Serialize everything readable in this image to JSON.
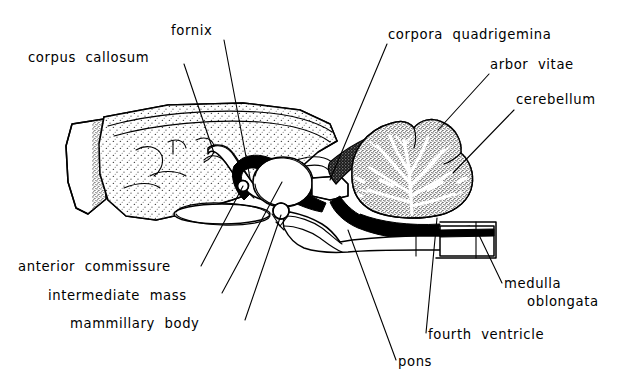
{
  "figure": {
    "background_color": "#ffffff",
    "ink_color": "#000000",
    "stipple_color": "#6b6b6b"
  },
  "labels": [
    {
      "id": "fornix",
      "text": "fornix",
      "x": 171,
      "y": 35,
      "anchor": "start"
    },
    {
      "id": "corpus-callosum",
      "text": "corpus  callosum",
      "x": 28,
      "y": 62,
      "anchor": "start"
    },
    {
      "id": "corpora-quadrigemina",
      "text": "corpora  quadrigemina",
      "x": 388,
      "y": 39,
      "anchor": "start"
    },
    {
      "id": "arbor-vitae",
      "text": "arbor  vitae",
      "x": 490,
      "y": 69,
      "anchor": "start"
    },
    {
      "id": "cerebellum",
      "text": "cerebellum",
      "x": 516,
      "y": 104,
      "anchor": "start"
    },
    {
      "id": "anterior-commissure",
      "text": "anterior  commissure",
      "x": 18,
      "y": 271,
      "anchor": "start"
    },
    {
      "id": "intermediate-mass",
      "text": "intermediate  mass",
      "x": 48,
      "y": 300,
      "anchor": "start"
    },
    {
      "id": "mammillary-body",
      "text": "mammillary  body",
      "x": 70,
      "y": 328,
      "anchor": "start"
    },
    {
      "id": "medulla",
      "text": "medulla",
      "x": 504,
      "y": 288,
      "anchor": "start"
    },
    {
      "id": "oblongata",
      "text": "oblongata",
      "x": 527,
      "y": 306,
      "anchor": "start"
    },
    {
      "id": "fourth-ventricle",
      "text": "fourth  ventricle",
      "x": 428,
      "y": 339,
      "anchor": "start"
    },
    {
      "id": "pons",
      "text": "pons",
      "x": 398,
      "y": 366,
      "anchor": "start"
    }
  ],
  "leader_lines": [
    {
      "id": "leader-fornix",
      "from_label": "fornix",
      "d": "M 224 40 L 250 178"
    },
    {
      "id": "leader-corpus-callosum",
      "from_label": "corpus-callosum",
      "d": "M 184 64 L 214 153"
    },
    {
      "id": "leader-corpora-quadrigemina",
      "from_label": "corpora-quadrigemina",
      "d": "M 387 44 L 330 180"
    },
    {
      "id": "leader-arbor-vitae",
      "from_label": "arbor-vitae",
      "d": "M 489 74 L 438 130"
    },
    {
      "id": "leader-cerebellum",
      "from_label": "cerebellum",
      "d": "M 514 110 L 453 173"
    },
    {
      "id": "leader-anterior-commissure",
      "from_label": "anterior-commissure",
      "d": "M 201 266 L 243 186"
    },
    {
      "id": "leader-intermediate-mass",
      "from_label": "intermediate-mass",
      "d": "M 222 293 L 282 182"
    },
    {
      "id": "leader-mammillary-body",
      "from_label": "mammillary-body",
      "d": "M 245 320 L 281 215"
    },
    {
      "id": "leader-medulla-oblongata",
      "from_label": "medulla",
      "d": "M 502 283 L 478 233"
    },
    {
      "id": "leader-fourth-ventricle",
      "from_label": "fourth-ventricle",
      "d": "M 426 333 L 437 218"
    },
    {
      "id": "leader-pons",
      "from_label": "pons",
      "d": "M 396 360 L 348 230"
    }
  ],
  "anatomy_parts": [
    {
      "id": "cerebrum",
      "name": "cerebrum"
    },
    {
      "id": "olfactory-bulb",
      "name": "olfactory-bulb"
    },
    {
      "id": "corpus-callosum-band",
      "name": "corpus-callosum-band"
    },
    {
      "id": "thalamus-intermediate-mass",
      "name": "intermediate-mass"
    },
    {
      "id": "third-ventricle",
      "name": "third-ventricle"
    },
    {
      "id": "cerebellum-body",
      "name": "cerebellum"
    },
    {
      "id": "arbor-vitae-pattern",
      "name": "arbor-vitae"
    },
    {
      "id": "pons-body",
      "name": "pons"
    },
    {
      "id": "medulla-body",
      "name": "medulla-oblongata"
    },
    {
      "id": "fourth-ventricle-cavity",
      "name": "fourth-ventricle"
    },
    {
      "id": "anterior-commissure-node",
      "name": "anterior-commissure"
    },
    {
      "id": "mammillary-body-node",
      "name": "mammillary-body"
    },
    {
      "id": "corpora-quadrigemina-region",
      "name": "corpora-quadrigemina"
    },
    {
      "id": "optic-chiasm",
      "name": "optic-chiasm"
    }
  ]
}
